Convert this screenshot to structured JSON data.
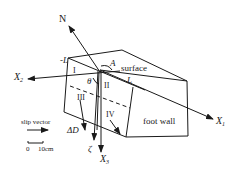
{
  "diagram": {
    "axes": {
      "N": "N",
      "X1": "X",
      "X1_sub": "1",
      "X2": "X",
      "X2_sub": "2",
      "X3": "X",
      "X3_sub": "3",
      "zeta": "ζ",
      "deltaD": "ΔD"
    },
    "labels": {
      "neg_L": "-L",
      "L": "L",
      "A": "A",
      "theta": "θ",
      "surface": "surface",
      "foot_wall": "foot wall"
    },
    "regions": [
      "I",
      "II",
      "III",
      "IV"
    ],
    "legend": {
      "title": "slip vector",
      "scale_start": "0",
      "scale_end": "10cm"
    },
    "colors": {
      "ink": "#1a1a1a",
      "background": "#ffffff"
    }
  }
}
